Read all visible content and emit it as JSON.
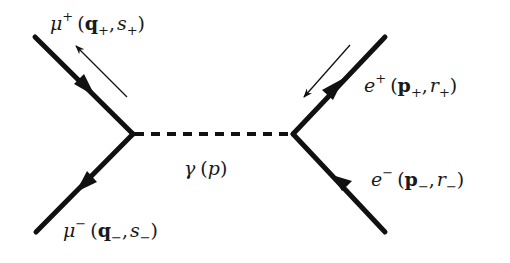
{
  "diagram": {
    "type": "feynman-diagram",
    "process": "e+ e- -> gamma -> mu+ mu-",
    "colors": {
      "line": "#111111",
      "background": "#ffffff"
    },
    "propagator": {
      "particle": "γ",
      "momentum": "p",
      "label_open": "(",
      "label_close": ")"
    },
    "external_legs": [
      {
        "id": "mu-plus",
        "particle": "μ",
        "charge": "+",
        "momentum": "q",
        "momentum_sub": "+",
        "spin": "s",
        "spin_sub": "+",
        "position": "top-left"
      },
      {
        "id": "mu-minus",
        "particle": "μ",
        "charge": "−",
        "momentum": "q",
        "momentum_sub": "−",
        "spin": "s",
        "spin_sub": "−",
        "position": "bottom-left"
      },
      {
        "id": "e-plus",
        "particle": "e",
        "charge": "+",
        "momentum": "p",
        "momentum_sub": "+",
        "spin": "r",
        "spin_sub": "+",
        "position": "top-right"
      },
      {
        "id": "e-minus",
        "particle": "e",
        "charge": "−",
        "momentum": "p",
        "momentum_sub": "−",
        "spin": "r",
        "spin_sub": "−",
        "position": "bottom-right"
      }
    ],
    "punct": {
      "open": "(",
      "comma": ",",
      "close": ")"
    }
  }
}
